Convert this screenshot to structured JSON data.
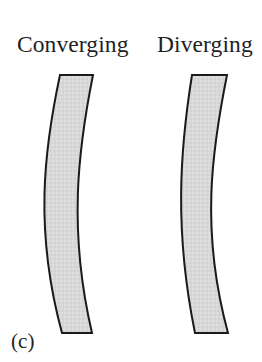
{
  "figure": {
    "panel_label": "(c)",
    "background_color": "#ffffff",
    "width": 262,
    "height": 362
  },
  "labels": {
    "converging": "Converging",
    "diverging": "Diverging"
  },
  "style": {
    "lens_fill_color": "#d6d6d6",
    "lens_fill_color_light": "#e0e0e0",
    "lens_outline_color": "#1a1a1a",
    "lens_outline_width": "2",
    "text_color": "#1f1f1f"
  },
  "shapes": {
    "converging_lens": {
      "name": "converging-meniscus-lens",
      "top_left_x": 60,
      "top_right_x": 93,
      "top_y": 75,
      "mid_left_x": 35,
      "mid_right_x": 70,
      "mid_y": 205,
      "bottom_left_x": 62,
      "bottom_right_x": 92,
      "bottom_y": 333,
      "path": "M 60 75 L 93 75 C 78 150 68 230 92 333 L 62 333 C 34 230 44 150 60 75 Z"
    },
    "diverging_lens": {
      "name": "diverging-meniscus-lens",
      "top_left_x": 192,
      "top_right_x": 227,
      "top_y": 75,
      "mid_left_x": 178,
      "mid_right_x": 206,
      "mid_y": 205,
      "bottom_left_x": 195,
      "bottom_right_x": 228,
      "bottom_y": 333,
      "path": "M 192 75 L 227 75 C 212 150 200 230 228 333 L 195 333 C 174 230 180 150 192 75 Z"
    }
  }
}
